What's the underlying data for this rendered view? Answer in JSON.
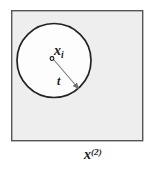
{
  "figure": {
    "kind": "geometry-diagram",
    "canvas": {
      "width": 154,
      "height": 172,
      "background": "#ffffff"
    },
    "outer_square": {
      "name": "feature-space-region",
      "x": 11,
      "y": 10,
      "width": 132,
      "height": 131,
      "fill": "#eeeeee",
      "stroke": "#555555",
      "stroke_width": 1.4
    },
    "circle": {
      "name": "neighborhood-ball",
      "cx": 54,
      "cy": 60.5,
      "r": 37,
      "fill": "#fdfdfd",
      "stroke": "#222222",
      "stroke_width": 1.6
    },
    "center_point": {
      "cx": 52,
      "cy": 58.5,
      "r": 1.9,
      "fill": "#ffffff",
      "stroke": "#111111"
    },
    "radius_arrow": {
      "x1": 54,
      "y1": 60,
      "x2": 79,
      "y2": 89,
      "stroke": "#777777",
      "stroke_width": 1.1,
      "arrowhead": true
    },
    "labels": {
      "center": {
        "base": "x",
        "sub": "i",
        "full": "x_i"
      },
      "radius": {
        "base": "t",
        "full": "t"
      },
      "axis": {
        "base": "x",
        "sup": "(2)",
        "full": "x^(2)"
      }
    },
    "colors": {
      "square_fill": "#eeeeee",
      "square_stroke": "#555555",
      "circle_fill": "#fdfdfd",
      "circle_stroke": "#222222",
      "arrow_stroke": "#777777",
      "text": "#1a1a1a",
      "page_background": "#ffffff"
    }
  }
}
